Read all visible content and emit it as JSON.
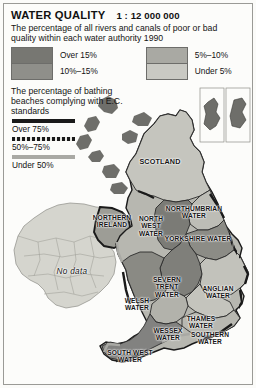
{
  "header": {
    "title": "WATER QUALITY",
    "scale": "1 : 12 000 000",
    "subtitle": "The percentage of all rivers and canals of poor or bad quality within each water authority 1990"
  },
  "quality_legend": {
    "items": [
      {
        "label": "Over 15%",
        "color": "#777772"
      },
      {
        "label": "10%–15%",
        "color": "#8f8f8a"
      },
      {
        "label": "5%–10%",
        "color": "#a9a9a3"
      },
      {
        "label": "Under 5%",
        "color": "#c9c9c3"
      }
    ]
  },
  "beaches_legend": {
    "title": "The percentage of bathing beaches complying with E.C. standards",
    "items": [
      {
        "label": "Over 75%",
        "style": "solid"
      },
      {
        "label": "50%–75%",
        "style": "dashed"
      },
      {
        "label": "Under 50%",
        "style": "light"
      }
    ]
  },
  "map": {
    "labels": [
      {
        "name": "scotland",
        "text": "SCOTLAND"
      },
      {
        "name": "northern-ireland",
        "text": "NORTHERN\nIRELAND"
      },
      {
        "name": "no-data",
        "text": "No data"
      },
      {
        "name": "northumbrian-water",
        "text": "NORTHUMBRIAN\nWATER"
      },
      {
        "name": "north-west-water",
        "text": "NORTH\nWEST\nWATER"
      },
      {
        "name": "yorkshire-water",
        "text": "YORKSHIRE WATER"
      },
      {
        "name": "severn-trent-water",
        "text": "SEVERN\nTRENT\nWATER"
      },
      {
        "name": "anglian-water",
        "text": "ANGLIAN\nWATER"
      },
      {
        "name": "welsh-water",
        "text": "WELSH\nWATER"
      },
      {
        "name": "thames-water",
        "text": "THAMES\nWATER"
      },
      {
        "name": "wessex-water",
        "text": "WESSEX\nWATER"
      },
      {
        "name": "southern-water",
        "text": "SOUTHERN\nWATER"
      },
      {
        "name": "south-west-water",
        "text": "SOUTH WEST\nWATER"
      }
    ]
  },
  "colors": {
    "sea": "#fbfbf9",
    "no_data_fill": "#d5d5ce",
    "frame": "#9a9a96",
    "outline": "#1a1a1a",
    "text": "#141414"
  }
}
